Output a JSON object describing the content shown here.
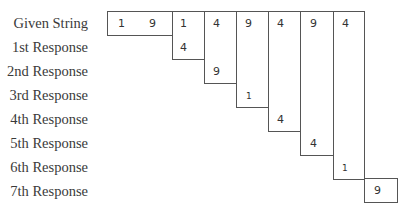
{
  "rows": [
    {
      "label": "Given String"
    },
    {
      "label": "1st Response"
    },
    {
      "label": "2nd Response"
    },
    {
      "label": "3rd Response"
    },
    {
      "label": "4th Response"
    },
    {
      "label": "5th Response"
    },
    {
      "label": "6th Response"
    },
    {
      "label": "7th Response"
    }
  ],
  "given_string": {
    "first_box": [
      "1",
      "9"
    ],
    "columns": [
      "1",
      "4",
      "9",
      "4",
      "9",
      "4"
    ]
  },
  "responses": [
    {
      "row": 1,
      "column": 1,
      "value": "4"
    },
    {
      "row": 2,
      "column": 2,
      "value": "9"
    },
    {
      "row": 3,
      "column": 3,
      "value": "1"
    },
    {
      "row": 4,
      "column": 4,
      "value": "4"
    },
    {
      "row": 5,
      "column": 5,
      "value": "4"
    },
    {
      "row": 6,
      "column": 6,
      "value": "1"
    },
    {
      "row": 7,
      "column": 7,
      "value": "9"
    }
  ]
}
